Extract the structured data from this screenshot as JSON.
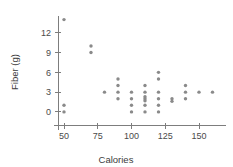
{
  "chart_data": {
    "type": "scatter",
    "title": "",
    "xlabel": "Calories",
    "ylabel": "Fiber (g)",
    "xlim": [
      40,
      170
    ],
    "ylim": [
      -1,
      15
    ],
    "xticks": [
      50,
      75,
      100,
      125,
      150
    ],
    "yticks": [
      0,
      3,
      6,
      9,
      12
    ],
    "xtick_labels": [
      "50",
      "75",
      "100",
      "125",
      "150"
    ],
    "ytick_labels": [
      "0",
      "3",
      "6",
      "9",
      "12"
    ],
    "grid": false,
    "legend": null,
    "marker_color": "#8a8a8a",
    "axis_color": "#7d7d7d",
    "points": [
      {
        "x": 50,
        "y": 14
      },
      {
        "x": 50,
        "y": 1
      },
      {
        "x": 50,
        "y": 0
      },
      {
        "x": 70,
        "y": 10
      },
      {
        "x": 70,
        "y": 9
      },
      {
        "x": 80,
        "y": 3
      },
      {
        "x": 90,
        "y": 5
      },
      {
        "x": 90,
        "y": 4
      },
      {
        "x": 90,
        "y": 3
      },
      {
        "x": 90,
        "y": 2
      },
      {
        "x": 100,
        "y": 3
      },
      {
        "x": 100,
        "y": 2
      },
      {
        "x": 100,
        "y": 1
      },
      {
        "x": 100,
        "y": 0
      },
      {
        "x": 110,
        "y": 4
      },
      {
        "x": 110,
        "y": 3
      },
      {
        "x": 110,
        "y": 2.3
      },
      {
        "x": 110,
        "y": 2
      },
      {
        "x": 110,
        "y": 1.7
      },
      {
        "x": 110,
        "y": 1
      },
      {
        "x": 110,
        "y": 0
      },
      {
        "x": 120,
        "y": 6
      },
      {
        "x": 120,
        "y": 5
      },
      {
        "x": 120,
        "y": 3
      },
      {
        "x": 120,
        "y": 2
      },
      {
        "x": 120,
        "y": 1
      },
      {
        "x": 120,
        "y": 0
      },
      {
        "x": 130,
        "y": 2
      },
      {
        "x": 130,
        "y": 1.6
      },
      {
        "x": 140,
        "y": 4
      },
      {
        "x": 140,
        "y": 3
      },
      {
        "x": 140,
        "y": 2
      },
      {
        "x": 150,
        "y": 3
      },
      {
        "x": 160,
        "y": 3
      }
    ]
  },
  "labels": {
    "x_axis_title": "Calories",
    "y_axis_title": "Fiber (g)"
  }
}
